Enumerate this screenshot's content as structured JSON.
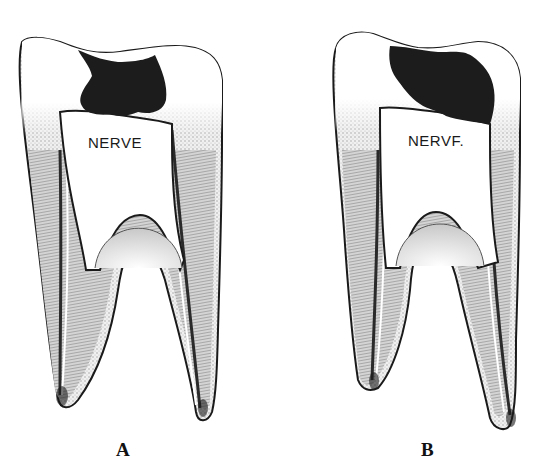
{
  "figures": [
    {
      "id": "A",
      "label": "A",
      "nerve_label": "NERVE",
      "description": "Tooth cross-section with cavity in enamel/dentin, not reaching nerve"
    },
    {
      "id": "B",
      "label": "B",
      "nerve_label": "NERVF.",
      "description": "Tooth cross-section with cavity extending down to the nerve chamber"
    }
  ],
  "colors": {
    "outline": "#1a1a1a",
    "cavity": "#1c1c1c",
    "shading": "#8a8a8a",
    "background": "#ffffff"
  }
}
